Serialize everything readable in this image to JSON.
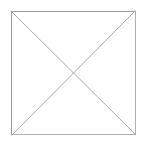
{
  "graphic": {
    "kind": "image-placeholder",
    "description": "Square outline crossed by two diagonals forming an X",
    "alt_text": "",
    "canvas": {
      "width": 147,
      "height": 148,
      "background_color": "#ffffff"
    },
    "square": {
      "name": "placeholder-square",
      "left": 11,
      "top": 11,
      "right": 136,
      "bottom": 135,
      "width": 125,
      "height": 124,
      "stroke_color": "#b0b0b0",
      "stroke_color_shadow": "#9a9a9a",
      "stroke_width": 1,
      "fill_color": "#ffffff"
    },
    "diagonals": {
      "name": "placeholder-cross",
      "stroke_color": "#a8a8a8",
      "stroke_width": 1,
      "intersection": {
        "x": 73,
        "y": 73
      },
      "lines": [
        {
          "name": "diagonal-top-left-to-bottom-right",
          "x1": 11,
          "y1": 11,
          "x2": 136,
          "y2": 135
        },
        {
          "name": "diagonal-bottom-left-to-top-right",
          "x1": 11,
          "y1": 135,
          "x2": 136,
          "y2": 11
        }
      ]
    }
  }
}
